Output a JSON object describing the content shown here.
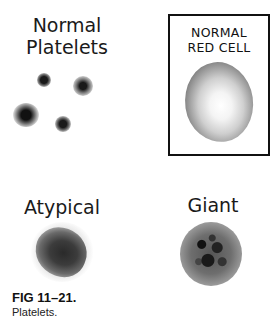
{
  "figure": {
    "panels": {
      "normal_platelets": {
        "label_line1": "Normal",
        "label_line2": "Platelets"
      },
      "normal_red_cell": {
        "label_line1": "NORMAL",
        "label_line2": "RED CELL"
      },
      "atypical": {
        "label": "Atypical"
      },
      "giant": {
        "label": "Giant"
      }
    },
    "caption": {
      "title": "FIG 11–21.",
      "text": "Platelets."
    }
  }
}
